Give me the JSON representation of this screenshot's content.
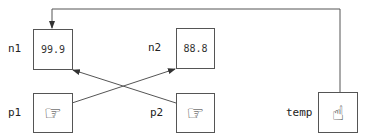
{
  "variables": [
    {
      "id": "n1",
      "label": "n1",
      "value": "99.9"
    },
    {
      "id": "n2",
      "label": "n2",
      "value": "88.8"
    },
    {
      "id": "p1",
      "label": "p1",
      "icon": "pointing-right-hand-icon",
      "glyph": "☞"
    },
    {
      "id": "p2",
      "label": "p2",
      "icon": "pointing-right-hand-icon",
      "glyph": "☞"
    },
    {
      "id": "temp",
      "label": "temp",
      "icon": "pointing-up-hand-icon",
      "glyph": "☝"
    }
  ],
  "arrows": [
    {
      "from": "temp",
      "to": "n1"
    },
    {
      "from": "p1",
      "to": "n2"
    },
    {
      "from": "p2",
      "to": "n1"
    }
  ],
  "colors": {
    "line": "#555555",
    "text": "#222222"
  }
}
